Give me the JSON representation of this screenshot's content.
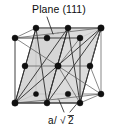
{
  "figure": {
    "type": "crystal-structure-diagram",
    "width": 118,
    "height": 129,
    "background_color": "#ffffff"
  },
  "labels": {
    "plane_label": "Plane (111)",
    "lattice_label": "a/√2",
    "lattice_label_parts": {
      "numerator": "a",
      "slash": "/",
      "radical": "√",
      "radicand": "2"
    }
  },
  "colors": {
    "atom": "#101010",
    "edge": "#2b2b2b",
    "edge_back": "#555555",
    "plane_fill": "#cfcfcf",
    "plane_stroke": "#3a3a3a",
    "leader": "#1a1a1a",
    "text": "#0d0d0d"
  },
  "geometry": {
    "cell_vertices": {
      "front_bottom_left": [
        15,
        103
      ],
      "front_bottom_right": [
        80,
        103
      ],
      "front_top_left": [
        15,
        38
      ],
      "front_top_right": [
        80,
        38
      ],
      "back_bottom_left": [
        36,
        94
      ],
      "back_bottom_right": [
        101,
        94
      ],
      "back_top_left": [
        36,
        28
      ],
      "back_top_right": [
        101,
        28
      ]
    },
    "atom_count": 14,
    "atoms": [
      [
        15,
        103
      ],
      [
        80,
        103
      ],
      [
        15,
        38
      ],
      [
        80,
        38
      ],
      [
        36,
        94
      ],
      [
        101,
        94
      ],
      [
        36,
        28
      ],
      [
        101,
        28
      ],
      [
        47,
        38
      ],
      [
        68,
        28
      ],
      [
        47,
        103
      ],
      [
        68,
        94
      ],
      [
        58,
        66
      ],
      [
        25,
        66
      ],
      [
        90,
        66
      ],
      [
        58,
        33
      ],
      [
        58,
        99
      ]
    ],
    "planes": [
      {
        "name": "plane-111-left",
        "points": "15,103 36,28 68,28 47,103"
      },
      {
        "name": "plane-111-right",
        "points": "47,103 68,28 101,28 80,103"
      }
    ],
    "leaders": {
      "plane_leader": {
        "from": [
          47,
          17
        ],
        "to": [
          53,
          33
        ]
      },
      "lattice_leader_left": {
        "from": [
          64,
          113
        ],
        "to": [
          59,
          100
        ]
      },
      "lattice_leader_right": {
        "from": [
          70,
          113
        ],
        "to": [
          80,
          100
        ]
      }
    }
  }
}
